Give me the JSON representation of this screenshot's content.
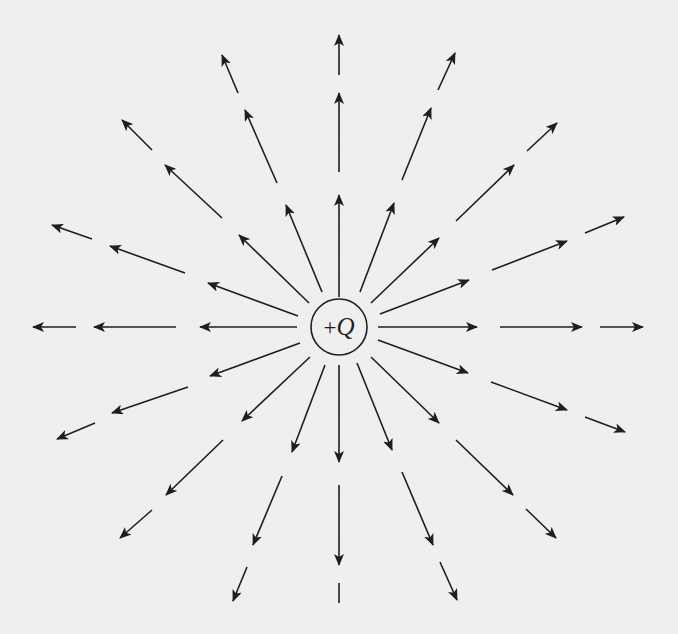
{
  "figure": {
    "charge": {
      "sign": "+",
      "symbol": "Q",
      "label": "+Q",
      "center": [
        339,
        327
      ],
      "radius": 28
    },
    "colors": {
      "background": "#f1f1f0",
      "ink": "#1e1e1e"
    },
    "field_lines": [
      {
        "direction": "up",
        "segments": [
          [
            [
              339,
              297
            ],
            [
              339,
              195
            ]
          ],
          [
            [
              339,
              172
            ],
            [
              339,
              93
            ]
          ],
          [
            [
              339,
              75
            ],
            [
              339,
              35
            ]
          ]
        ]
      },
      {
        "direction": "up-right-steep",
        "segments": [
          [
            [
              360,
              292
            ],
            [
              394,
              203
            ]
          ],
          [
            [
              402,
              180
            ],
            [
              431,
              108
            ]
          ],
          [
            [
              438,
              90
            ],
            [
              455,
              53
            ]
          ]
        ]
      },
      {
        "direction": "up-right",
        "segments": [
          [
            [
              371,
              303
            ],
            [
              439,
              238
            ]
          ],
          [
            [
              456,
              221
            ],
            [
              514,
              165
            ]
          ],
          [
            [
              527,
              151
            ],
            [
              557,
              123
            ]
          ]
        ]
      },
      {
        "direction": "up-right-shallow",
        "segments": [
          [
            [
              380,
              314
            ],
            [
              469,
              280
            ]
          ],
          [
            [
              492,
              270
            ],
            [
              567,
              241
            ]
          ],
          [
            [
              585,
              233
            ],
            [
              624,
              217
            ]
          ]
        ]
      },
      {
        "direction": "right",
        "segments": [
          [
            [
              378,
              327
            ],
            [
              477,
              327
            ]
          ],
          [
            [
              500,
              327
            ],
            [
              582,
              327
            ]
          ],
          [
            [
              600,
              327
            ],
            [
              643,
              327
            ]
          ]
        ]
      },
      {
        "direction": "down-right-shallow",
        "segments": [
          [
            [
              378,
              340
            ],
            [
              468,
              373
            ]
          ],
          [
            [
              491,
              382
            ],
            [
              567,
              410
            ]
          ],
          [
            [
              585,
              417
            ],
            [
              625,
              432
            ]
          ]
        ]
      },
      {
        "direction": "down-right",
        "segments": [
          [
            [
              371,
              357
            ],
            [
              439,
              423
            ]
          ],
          [
            [
              456,
              440
            ],
            [
              513,
              495
            ]
          ],
          [
            [
              526,
              509
            ],
            [
              556,
              538
            ]
          ]
        ]
      },
      {
        "direction": "down-right-steep",
        "segments": [
          [
            [
              357,
              363
            ],
            [
              392,
              450
            ]
          ],
          [
            [
              402,
              472
            ],
            [
              433,
              545
            ]
          ],
          [
            [
              440,
              562
            ],
            [
              457,
              600
            ]
          ]
        ]
      },
      {
        "direction": "down",
        "segments": [
          [
            [
              339,
              365
            ],
            [
              339,
              462
            ]
          ],
          [
            [
              339,
              485
            ],
            [
              339,
              565
            ]
          ],
          [
            [
              339,
              583
            ],
            [
              339,
              603
            ],
            "noarrow"
          ]
        ]
      },
      {
        "direction": "down-left-steep",
        "segments": [
          [
            [
              325,
              365
            ],
            [
              292,
              452
            ]
          ],
          [
            [
              282,
              476
            ],
            [
              253,
              545
            ]
          ],
          [
            [
              247,
              567
            ],
            [
              233,
              601
            ]
          ]
        ]
      },
      {
        "direction": "down-left",
        "segments": [
          [
            [
              310,
              357
            ],
            [
              242,
              421
            ]
          ],
          [
            [
              223,
              440
            ],
            [
              166,
              495
            ]
          ],
          [
            [
              152,
              510
            ],
            [
              120,
              538
            ]
          ]
        ]
      },
      {
        "direction": "down-left-shallow",
        "segments": [
          [
            [
              300,
              343
            ],
            [
              210,
              376
            ]
          ],
          [
            [
              188,
              387
            ],
            [
              112,
              413
            ]
          ],
          [
            [
              95,
              423
            ],
            [
              57,
              439
            ]
          ]
        ]
      },
      {
        "direction": "left",
        "segments": [
          [
            [
              297,
              327
            ],
            [
              200,
              327
            ]
          ],
          [
            [
              176,
              327
            ],
            [
              94,
              327
            ]
          ],
          [
            [
              76,
              327
            ],
            [
              33,
              327
            ]
          ]
        ]
      },
      {
        "direction": "up-left-shallow",
        "segments": [
          [
            [
              298,
              316
            ],
            [
              208,
              283
            ]
          ],
          [
            [
              185,
              273
            ],
            [
              110,
              246
            ]
          ],
          [
            [
              92,
              239
            ],
            [
              52,
              225
            ]
          ]
        ]
      },
      {
        "direction": "up-left",
        "segments": [
          [
            [
              309,
              303
            ],
            [
              239,
              235
            ]
          ],
          [
            [
              222,
              218
            ],
            [
              165,
              165
            ]
          ],
          [
            [
              152,
              150
            ],
            [
              122,
              120
            ]
          ]
        ]
      },
      {
        "direction": "up-left-steep",
        "segments": [
          [
            [
              322,
              292
            ],
            [
              286,
              205
            ]
          ],
          [
            [
              277,
              183
            ],
            [
              245,
              110
            ]
          ],
          [
            [
              238,
              93
            ],
            [
              222,
              55
            ]
          ]
        ]
      }
    ]
  }
}
